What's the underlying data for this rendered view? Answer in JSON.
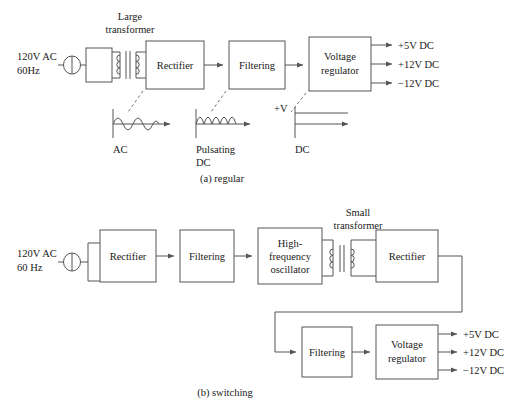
{
  "figure": {
    "captions": {
      "a": "(a) regular",
      "b": "(b) switching"
    }
  },
  "regular": {
    "source": {
      "line1": "120V AC",
      "line2": "60Hz",
      "plug_icon": "ac-plug-icon"
    },
    "transformer": {
      "label_line1": "Large",
      "label_line2": "transformer",
      "icon": "transformer-icon"
    },
    "blocks": [
      {
        "id": "rectifier",
        "label": "Rectifier"
      },
      {
        "id": "filtering",
        "label": "Filtering"
      },
      {
        "id": "voltage-regulator",
        "label_line1": "Voltage",
        "label_line2": "regulator"
      }
    ],
    "outputs": [
      {
        "label": "+5V DC"
      },
      {
        "label": "+12V DC"
      },
      {
        "label": "−12V DC"
      }
    ],
    "waveforms": [
      {
        "id": "ac",
        "label_line1": "AC",
        "label_line2": "",
        "type": "sine",
        "axis_label": ""
      },
      {
        "id": "pulsating-dc",
        "label_line1": "Pulsating",
        "label_line2": "DC",
        "type": "rectified-sine",
        "axis_label": ""
      },
      {
        "id": "dc",
        "label_line1": "DC",
        "label_line2": "",
        "type": "flat",
        "axis_label": "+V"
      }
    ]
  },
  "switching": {
    "source": {
      "line1": "120V AC",
      "line2": "60 Hz",
      "plug_icon": "ac-plug-icon"
    },
    "transformer": {
      "label_line1": "Small",
      "label_line2": "transformer",
      "icon": "transformer-icon"
    },
    "blocks": [
      {
        "id": "rectifier-1",
        "label": "Rectifier"
      },
      {
        "id": "filtering-1",
        "label": "Filtering"
      },
      {
        "id": "oscillator",
        "label_line1": "High-",
        "label_line2": "frequency",
        "label_line3": "oscillator"
      },
      {
        "id": "rectifier-2",
        "label": "Rectifier"
      },
      {
        "id": "filtering-2",
        "label": "Filtering"
      },
      {
        "id": "voltage-regulator",
        "label_line1": "Voltage",
        "label_line2": "regulator"
      }
    ],
    "outputs": [
      {
        "label": "+5V DC"
      },
      {
        "label": "+12V DC"
      },
      {
        "label": "−12V DC"
      }
    ]
  },
  "colors": {
    "stroke": "#555555",
    "text": "#1a1a1a",
    "background": "#ffffff"
  }
}
